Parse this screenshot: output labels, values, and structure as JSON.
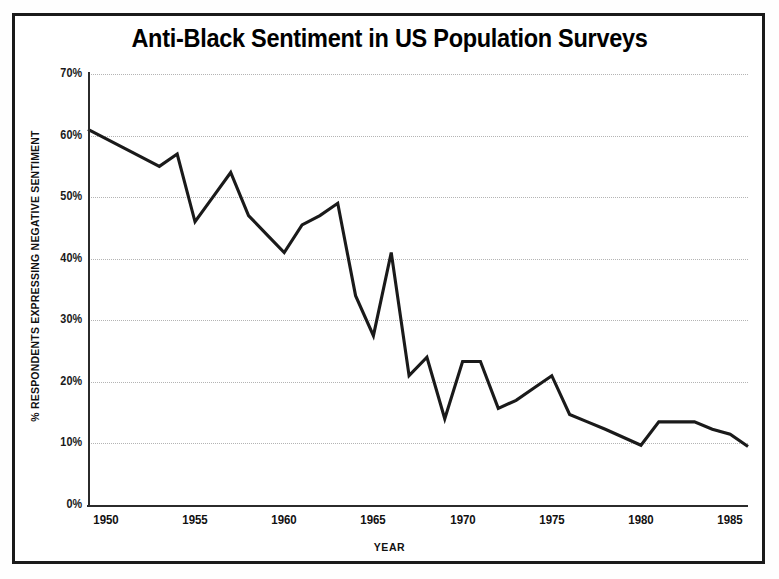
{
  "chart_data": {
    "type": "line",
    "title": "Anti-Black Sentiment in US Population Surveys",
    "xlabel": "YEAR",
    "ylabel": "% RESPONDENTS EXPRESSING NEGATIVE SENTIMENT",
    "xlim": [
      1949,
      1986
    ],
    "ylim": [
      0,
      70
    ],
    "grid": true,
    "legend": "none",
    "line_color": "#1a1a1a",
    "y_ticks": [
      0,
      10,
      20,
      30,
      40,
      50,
      60,
      70
    ],
    "y_tick_labels": [
      "0%",
      "10%",
      "20%",
      "30%",
      "40%",
      "50%",
      "60%",
      "70%"
    ],
    "x_ticks": [
      1950,
      1955,
      1960,
      1965,
      1970,
      1975,
      1980,
      1985
    ],
    "x_tick_labels": [
      "1950",
      "1955",
      "1960",
      "1965",
      "1970",
      "1975",
      "1980",
      "1985"
    ],
    "series": [
      {
        "name": "% respondents expressing negative sentiment",
        "x": [
          1949,
          1950,
          1951,
          1952,
          1953,
          1954,
          1955,
          1956,
          1957,
          1958,
          1959,
          1960,
          1961,
          1962,
          1963,
          1964,
          1965,
          1966,
          1967,
          1968,
          1969,
          1970,
          1971,
          1972,
          1973,
          1974,
          1975,
          1976,
          1977,
          1978,
          1979,
          1980,
          1981,
          1982,
          1983,
          1984,
          1985,
          1986
        ],
        "values": [
          61.0,
          59.5,
          58.0,
          56.5,
          55.0,
          57.0,
          46.0,
          50.0,
          54.0,
          47.0,
          44.0,
          41.0,
          45.5,
          47.0,
          49.0,
          34.0,
          27.5,
          41.0,
          21.0,
          24.0,
          14.0,
          23.3,
          23.3,
          15.7,
          17.0,
          19.0,
          21.0,
          14.7,
          13.5,
          12.3,
          11.0,
          9.7,
          13.5,
          13.5,
          13.5,
          12.3,
          11.5,
          9.5
        ]
      }
    ]
  }
}
